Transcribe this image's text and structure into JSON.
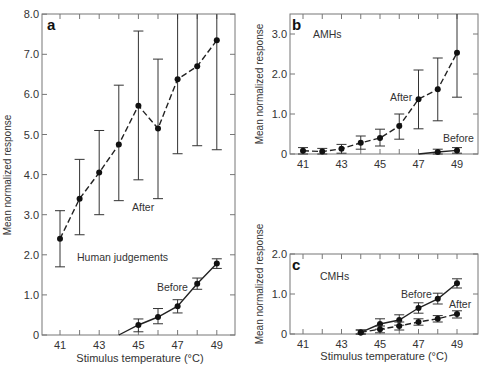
{
  "chart_data": [
    {
      "panel": "a",
      "type": "line",
      "title": "Human judgements",
      "xlabel": "Stimulus temperature (°C)",
      "ylabel": "Mean normalized response",
      "xlim": [
        40,
        50
      ],
      "ylim": [
        0,
        8.0
      ],
      "xticks": [
        "41",
        "43",
        "45",
        "47",
        "49"
      ],
      "yticks": [
        "0",
        "1.0",
        "2.0",
        "3.0",
        "4.0",
        "5.0",
        "6.0",
        "7.0",
        "8.0"
      ],
      "grid": false,
      "series": [
        {
          "name": "After",
          "style": "dashed",
          "x": [
            41,
            42,
            43,
            44,
            45,
            46,
            47,
            48,
            49
          ],
          "values": [
            2.4,
            3.4,
            4.05,
            4.75,
            5.72,
            5.15,
            6.38,
            6.7,
            7.35
          ],
          "err_low": [
            1.7,
            2.5,
            3.0,
            3.35,
            3.87,
            3.4,
            4.52,
            4.72,
            4.62
          ],
          "err_high": [
            3.1,
            4.38,
            5.1,
            6.23,
            7.58,
            6.88,
            8.0,
            8.0,
            8.0
          ]
        },
        {
          "name": "Before",
          "style": "solid",
          "x": [
            44,
            45,
            46,
            47,
            48,
            49
          ],
          "values": [
            0.0,
            0.25,
            0.45,
            0.72,
            1.28,
            1.78
          ],
          "err_low": [
            0.0,
            0.08,
            0.28,
            0.55,
            1.14,
            1.66
          ],
          "err_high": [
            0.0,
            0.4,
            0.66,
            0.88,
            1.42,
            1.9
          ]
        }
      ],
      "annotations": [
        "After",
        "Before",
        "Human judgements"
      ]
    },
    {
      "panel": "b",
      "type": "line",
      "title": "AMHs",
      "xlabel": "",
      "ylabel": "Mean normalized response",
      "xlim": [
        40,
        50
      ],
      "ylim": [
        0,
        3.5
      ],
      "xticks": [
        "41",
        "43",
        "45",
        "47",
        "49"
      ],
      "yticks": [
        "0",
        "1.0",
        "2.0",
        "3.0"
      ],
      "grid": false,
      "series": [
        {
          "name": "After",
          "style": "dashed",
          "x": [
            41,
            42,
            43,
            44,
            45,
            46,
            47,
            48,
            49
          ],
          "values": [
            0.08,
            0.06,
            0.13,
            0.28,
            0.4,
            0.7,
            1.37,
            1.62,
            2.53
          ],
          "err_low": [
            0.0,
            0.0,
            0.02,
            0.12,
            0.2,
            0.37,
            0.63,
            0.83,
            1.42
          ],
          "err_high": [
            0.16,
            0.14,
            0.24,
            0.45,
            0.62,
            1.0,
            2.1,
            2.4,
            3.5
          ]
        },
        {
          "name": "Before",
          "style": "solid",
          "x": [
            47,
            48,
            49
          ],
          "values": [
            0.0,
            0.05,
            0.09
          ],
          "err_low": [
            0.0,
            0.0,
            0.02
          ],
          "err_high": [
            0.0,
            0.12,
            0.16
          ]
        }
      ],
      "annotations": [
        "After",
        "Before",
        "AMHs"
      ]
    },
    {
      "panel": "c",
      "type": "line",
      "title": "CMHs",
      "xlabel": "Stimulus temperature (°C)",
      "ylabel": "Mean normalized response",
      "xlim": [
        40,
        50
      ],
      "ylim": [
        0,
        2.0
      ],
      "xticks": [
        "41",
        "43",
        "45",
        "47",
        "49"
      ],
      "yticks": [
        "0",
        "1.0",
        "2.0"
      ],
      "grid": false,
      "series": [
        {
          "name": "Before",
          "style": "solid",
          "x": [
            44,
            45,
            46,
            47,
            48,
            49
          ],
          "values": [
            0.04,
            0.25,
            0.35,
            0.65,
            0.88,
            1.27
          ],
          "err_low": [
            0.0,
            0.12,
            0.22,
            0.52,
            0.75,
            1.15
          ],
          "err_high": [
            0.1,
            0.38,
            0.48,
            0.78,
            1.02,
            1.38
          ]
        },
        {
          "name": "After",
          "style": "dashed",
          "x": [
            44,
            45,
            46,
            47,
            48,
            49
          ],
          "values": [
            0.04,
            0.12,
            0.2,
            0.3,
            0.38,
            0.5
          ],
          "err_low": [
            0.0,
            0.03,
            0.1,
            0.22,
            0.3,
            0.4
          ],
          "err_high": [
            0.1,
            0.2,
            0.3,
            0.38,
            0.46,
            0.58
          ]
        }
      ],
      "annotations": [
        "Before",
        "After",
        "CMHs"
      ]
    }
  ],
  "labels": {
    "panel_a": "a",
    "panel_b": "b",
    "panel_c": "c",
    "a_title": "Human judgements",
    "b_title": "AMHs",
    "c_title": "CMHs",
    "after": "After",
    "before": "Before",
    "ylabel": "Mean normalized response",
    "xlabel": "Stimulus temperature (°C)"
  }
}
